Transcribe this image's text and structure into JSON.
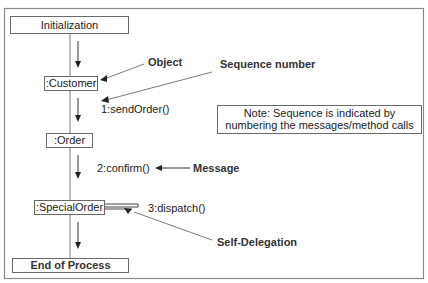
{
  "diagram": {
    "type": "UML collaboration/sequence diagram",
    "nodes": {
      "start": "Initialization",
      "customer": ":Customer",
      "order": ":Order",
      "special_order": ":SpecialOrder",
      "end": "End of Process"
    },
    "messages": {
      "m1": "1:sendOrder()",
      "m2": "2:confirm()",
      "m3": "3:dispatch()"
    },
    "annotations": {
      "object": "Object",
      "sequence_number": "Sequence number",
      "message": "Message",
      "self_delegation": "Self-Delegation"
    },
    "note": {
      "line1": "Note: Sequence is indicated by",
      "line2": "numbering the messages/method calls"
    }
  }
}
